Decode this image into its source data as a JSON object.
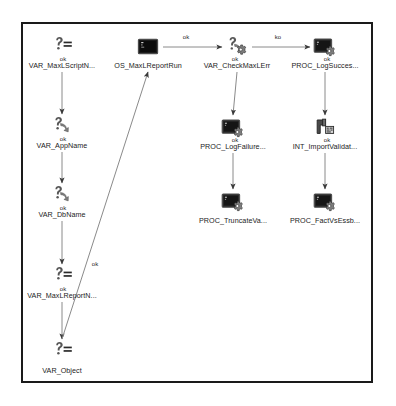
{
  "diagram": {
    "frame": {
      "stroke": "#1a1a1a"
    },
    "edge_colors": {
      "line": "#8a8a8a",
      "arrow": "#3a3a3a"
    },
    "nodes": [
      {
        "id": "var_maxl_script",
        "label": "VAR_MaxLScriptN...",
        "icon": "question-equals-icon",
        "x": 62,
        "y": 36
      },
      {
        "id": "var_app_name",
        "label": "VAR_AppName",
        "icon": "question-arrow-icon",
        "x": 62,
        "y": 116
      },
      {
        "id": "var_db_name",
        "label": "VAR_DbName",
        "icon": "question-arrow-icon",
        "x": 62,
        "y": 185
      },
      {
        "id": "var_maxl_report",
        "label": "VAR_MaxLReportN...",
        "icon": "question-equals-icon",
        "x": 62,
        "y": 266
      },
      {
        "id": "var_object",
        "label": "VAR_Object",
        "icon": "question-equals-icon",
        "x": 62,
        "y": 341
      },
      {
        "id": "os_maxl_report_run",
        "label": "OS_MaxLReportRun",
        "icon": "console-icon",
        "x": 148,
        "y": 36
      },
      {
        "id": "var_check_maxl_err",
        "label": "VAR_CheckMaxLErr",
        "icon": "question-gear-icon",
        "x": 237,
        "y": 36
      },
      {
        "id": "proc_log_failure",
        "label": "PROC_LogFailure...",
        "icon": "console-gear-icon",
        "x": 233,
        "y": 117
      },
      {
        "id": "proc_truncate_va",
        "label": "PROC_TruncateVa...",
        "icon": "console-gear-icon",
        "x": 233,
        "y": 191
      },
      {
        "id": "proc_log_success",
        "label": "PROC_LogSucces...",
        "icon": "console-gear-icon",
        "x": 325,
        "y": 36
      },
      {
        "id": "int_import_validat",
        "label": "INT_ImportValidat...",
        "icon": "pipe-data-icon",
        "x": 325,
        "y": 117
      },
      {
        "id": "proc_fact_vs_essb",
        "label": "PROC_FactVsEssb...",
        "icon": "console-gear-icon",
        "x": 325,
        "y": 191
      }
    ],
    "edges": [
      {
        "id": "e1",
        "from": "var_maxl_script",
        "to": "var_app_name",
        "label": "ok",
        "label_x": 63,
        "label_y": 59
      },
      {
        "id": "e2",
        "from": "var_app_name",
        "to": "var_db_name",
        "label": "ok",
        "label_x": 63,
        "label_y": 139
      },
      {
        "id": "e3",
        "from": "var_db_name",
        "to": "var_maxl_report",
        "label": "ok",
        "label_x": 63,
        "label_y": 208
      },
      {
        "id": "e4",
        "from": "var_maxl_report",
        "to": "var_object",
        "label": "ok",
        "label_x": 63,
        "label_y": 289
      },
      {
        "id": "e5",
        "from": "var_object",
        "to": "os_maxl_report_run",
        "label": "ok",
        "label_x": 95,
        "label_y": 264
      },
      {
        "id": "e6",
        "from": "os_maxl_report_run",
        "to": "var_check_maxl_err",
        "label": "ok",
        "label_x": 186,
        "label_y": 37
      },
      {
        "id": "e7",
        "from": "var_check_maxl_err",
        "to": "proc_log_success",
        "label": "ko",
        "label_x": 278,
        "label_y": 37
      },
      {
        "id": "e8",
        "from": "var_check_maxl_err",
        "to": "proc_log_failure",
        "label": "ok",
        "label_x": 235,
        "label_y": 59
      },
      {
        "id": "e9",
        "from": "proc_log_failure",
        "to": "proc_truncate_va",
        "label": "ok",
        "label_x": 235,
        "label_y": 140
      },
      {
        "id": "e10",
        "from": "proc_log_success",
        "to": "int_import_validat",
        "label": "ok",
        "label_x": 327,
        "label_y": 59
      },
      {
        "id": "e11",
        "from": "int_import_validat",
        "to": "proc_fact_vs_essb",
        "label": "ok",
        "label_x": 327,
        "label_y": 140
      }
    ]
  }
}
